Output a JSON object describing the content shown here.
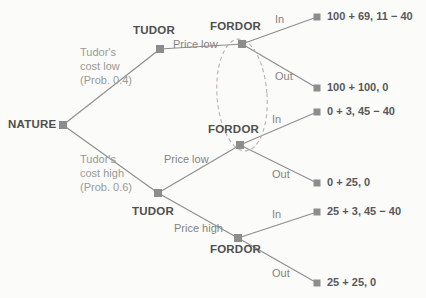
{
  "diagram": {
    "colors": {
      "node": "#8d8d8d",
      "edge": "#8f8f8f",
      "info_set": "#b9b2a6",
      "player_text": "#4f4f4d",
      "action_text": "#84847f",
      "chance_text": "#9a9a94",
      "payoff_text": "#58585a",
      "background": "#fbfbfa"
    },
    "nodes": [
      {
        "id": "nature",
        "label": "NATURE",
        "x": 63,
        "y": 125,
        "label_x": 8,
        "label_y": 118,
        "kind": "chance"
      },
      {
        "id": "tudor-low",
        "label": "TUDOR",
        "x": 160,
        "y": 49,
        "label_x": 133,
        "label_y": 24,
        "kind": "decision"
      },
      {
        "id": "tudor-high",
        "label": "TUDOR",
        "x": 158,
        "y": 193,
        "label_x": 132,
        "label_y": 205,
        "kind": "decision"
      },
      {
        "id": "fordor-top",
        "label": "FORDOR",
        "x": 242,
        "y": 44,
        "label_x": 210,
        "label_y": 20,
        "kind": "decision"
      },
      {
        "id": "fordor-mid",
        "label": "FORDOR",
        "x": 240,
        "y": 145,
        "label_x": 208,
        "label_y": 123,
        "kind": "decision"
      },
      {
        "id": "fordor-bot",
        "label": "FORDOR",
        "x": 238,
        "y": 238,
        "label_x": 210,
        "label_y": 243,
        "kind": "decision"
      }
    ],
    "terminals": [
      {
        "id": "t1",
        "payoff": "100 + 69, 11 − 40",
        "x": 317,
        "y": 17,
        "label_x": 327,
        "label_y": 10
      },
      {
        "id": "t2",
        "payoff": "100 + 100, 0",
        "x": 317,
        "y": 88,
        "label_x": 327,
        "label_y": 81
      },
      {
        "id": "t3",
        "payoff": "0 + 3, 45 − 40",
        "x": 317,
        "y": 112,
        "label_x": 327,
        "label_y": 105
      },
      {
        "id": "t4",
        "payoff": "0 + 25, 0",
        "x": 317,
        "y": 183,
        "label_x": 327,
        "label_y": 176
      },
      {
        "id": "t5",
        "payoff": "25 + 3, 45 − 40",
        "x": 317,
        "y": 212,
        "label_x": 327,
        "label_y": 205
      },
      {
        "id": "t6",
        "payoff": "25 + 25, 0",
        "x": 317,
        "y": 283,
        "label_x": 327,
        "label_y": 276
      }
    ],
    "edges": [
      {
        "id": "e-nature-low",
        "from": "nature",
        "to": "tudor-low",
        "x1": 63,
        "y1": 125,
        "x2": 160,
        "y2": 49
      },
      {
        "id": "e-nature-high",
        "from": "nature",
        "to": "tudor-high",
        "x1": 63,
        "y1": 125,
        "x2": 158,
        "y2": 193
      },
      {
        "id": "e-tudorlow-pricelow",
        "from": "tudor-low",
        "to": "fordor-top",
        "x1": 160,
        "y1": 49,
        "x2": 242,
        "y2": 44
      },
      {
        "id": "e-tudorhigh-pricelow",
        "from": "tudor-high",
        "to": "fordor-mid",
        "x1": 158,
        "y1": 193,
        "x2": 240,
        "y2": 145
      },
      {
        "id": "e-tudorhigh-pricehigh",
        "from": "tudor-high",
        "to": "fordor-bot",
        "x1": 158,
        "y1": 193,
        "x2": 238,
        "y2": 238
      },
      {
        "id": "e-fordortop-in",
        "from": "fordor-top",
        "to": "t1",
        "x1": 242,
        "y1": 44,
        "x2": 317,
        "y2": 17
      },
      {
        "id": "e-fordortop-out",
        "from": "fordor-top",
        "to": "t2",
        "x1": 242,
        "y1": 44,
        "x2": 317,
        "y2": 88
      },
      {
        "id": "e-fordormid-in",
        "from": "fordor-mid",
        "to": "t3",
        "x1": 240,
        "y1": 145,
        "x2": 317,
        "y2": 112
      },
      {
        "id": "e-fordormid-out",
        "from": "fordor-mid",
        "to": "t4",
        "x1": 240,
        "y1": 145,
        "x2": 317,
        "y2": 183
      },
      {
        "id": "e-fordorbot-in",
        "from": "fordor-bot",
        "to": "t5",
        "x1": 238,
        "y1": 238,
        "x2": 317,
        "y2": 212
      },
      {
        "id": "e-fordorbot-out",
        "from": "fordor-bot",
        "to": "t6",
        "x1": 238,
        "y1": 238,
        "x2": 317,
        "y2": 283
      }
    ],
    "chance_labels": [
      {
        "id": "chance-low",
        "line1": "Tudor's",
        "line2": "cost low",
        "line3": "(Prob. 0.4)",
        "x": 80,
        "y": 45
      },
      {
        "id": "chance-high",
        "line1": "Tudor's",
        "line2": "cost high",
        "line3": "(Prob. 0.6)",
        "x": 80,
        "y": 152
      }
    ],
    "action_labels": [
      {
        "id": "price-low-top",
        "text": "Price low",
        "x": 173,
        "y": 38
      },
      {
        "id": "price-low-bottom",
        "text": "Price low",
        "x": 164,
        "y": 153
      },
      {
        "id": "price-high",
        "text": "Price high",
        "x": 174,
        "y": 222
      },
      {
        "id": "in-top",
        "text": "In",
        "x": 275,
        "y": 13
      },
      {
        "id": "out-top",
        "text": "Out",
        "x": 275,
        "y": 70
      },
      {
        "id": "in-mid",
        "text": "In",
        "x": 272,
        "y": 113
      },
      {
        "id": "out-mid",
        "text": "Out",
        "x": 272,
        "y": 168
      },
      {
        "id": "in-bot",
        "text": "In",
        "x": 272,
        "y": 208
      },
      {
        "id": "out-bot",
        "text": "Out",
        "x": 272,
        "y": 267
      }
    ],
    "info_set": {
      "id": "fordor-information-set",
      "cx": 242,
      "cy": 95,
      "rx": 25,
      "ry": 56,
      "rotation": -4
    }
  }
}
